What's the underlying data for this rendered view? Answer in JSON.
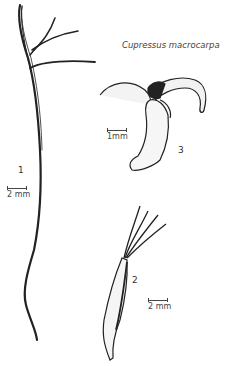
{
  "figure": {
    "species_title": "Cupressus macrocarpa",
    "specimens": [
      {
        "number": "1",
        "scale_label": "2 mm"
      },
      {
        "number": "2",
        "scale_label": "2 mm"
      },
      {
        "number": "3",
        "scale_label": "1mm"
      }
    ]
  }
}
